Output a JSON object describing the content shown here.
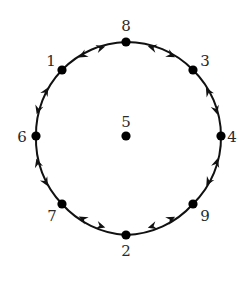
{
  "diagram": {
    "type": "cycle-graph",
    "center": {
      "x": 127,
      "y": 137
    },
    "radius": 93,
    "colors": {
      "stroke": "#111111",
      "node": "#000000",
      "label": "#2a2a2a",
      "background": "#ffffff"
    },
    "center_node": {
      "id": "5",
      "label": "5",
      "x": 126,
      "y": 136,
      "label_x": 126,
      "label_y": 127
    },
    "ring_nodes": [
      {
        "id": "8",
        "label": "8",
        "x": 126,
        "y": 42,
        "label_x": 126,
        "label_y": 31,
        "anchor": "middle"
      },
      {
        "id": "3",
        "label": "3",
        "x": 193,
        "y": 70,
        "label_x": 205,
        "label_y": 66,
        "anchor": "middle"
      },
      {
        "id": "4",
        "label": "4",
        "x": 221,
        "y": 136,
        "label_x": 232,
        "label_y": 142,
        "anchor": "middle"
      },
      {
        "id": "9",
        "label": "9",
        "x": 193,
        "y": 204,
        "label_x": 205,
        "label_y": 221,
        "anchor": "middle"
      },
      {
        "id": "2",
        "label": "2",
        "x": 126,
        "y": 235,
        "label_x": 126,
        "label_y": 256,
        "anchor": "middle"
      },
      {
        "id": "7",
        "label": "7",
        "x": 62,
        "y": 204,
        "label_x": 52,
        "label_y": 221,
        "anchor": "middle"
      },
      {
        "id": "6",
        "label": "6",
        "x": 36,
        "y": 136,
        "label_x": 22,
        "label_y": 142,
        "anchor": "middle"
      },
      {
        "id": "1",
        "label": "1",
        "x": 62,
        "y": 70,
        "label_x": 51,
        "label_y": 66,
        "anchor": "middle"
      }
    ],
    "edges": [
      {
        "from": "8",
        "to": "3",
        "arrows": "both-outward"
      },
      {
        "from": "3",
        "to": "4",
        "arrows": "both-outward"
      },
      {
        "from": "4",
        "to": "9",
        "arrows": "both-outward"
      },
      {
        "from": "9",
        "to": "2",
        "arrows": "both-outward"
      },
      {
        "from": "2",
        "to": "7",
        "arrows": "both-outward"
      },
      {
        "from": "7",
        "to": "6",
        "arrows": "both-outward"
      },
      {
        "from": "6",
        "to": "1",
        "arrows": "both-outward"
      },
      {
        "from": "1",
        "to": "8",
        "arrows": "both-outward"
      }
    ]
  }
}
